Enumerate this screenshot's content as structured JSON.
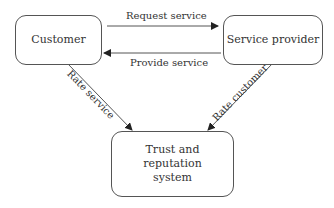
{
  "diagram": {
    "nodes": {
      "customer": {
        "label": "Customer"
      },
      "provider": {
        "label": "Service provider"
      },
      "trust": {
        "label": "Trust and reputation system"
      }
    },
    "edges": [
      {
        "from": "customer",
        "to": "provider",
        "label": "Request service"
      },
      {
        "from": "provider",
        "to": "customer",
        "label": "Provide service"
      },
      {
        "from": "customer",
        "to": "trust",
        "label": "Rate service"
      },
      {
        "from": "provider",
        "to": "trust",
        "label": "Rate customer"
      }
    ],
    "colors": {
      "stroke": "#555555",
      "text": "#333333",
      "background": "#ffffff"
    }
  }
}
